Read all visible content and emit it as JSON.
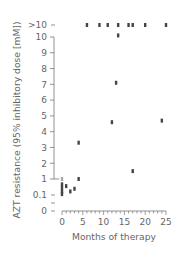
{
  "chart_data": {
    "type": "scatter",
    "title": "",
    "xlabel": "Months of therapy",
    "ylabel": "AZT resistance (95% inhibitory dose [mM])",
    "xlim": [
      0,
      25
    ],
    "x_ticks": [
      0,
      5,
      10,
      15,
      20,
      25
    ],
    "x_minor_tick_step": 1,
    "y_tick_labels": [
      "0",
      "0.1",
      "1",
      "2",
      "3",
      "4",
      "5",
      "6",
      "7",
      "8",
      "9",
      "10",
      ">10"
    ],
    "y_scale_note": "broken axis: 0, 0.1, 1 compressed; 1–10 linear; >10 category",
    "grid": false,
    "legend": null,
    "marker_color": "#444444",
    "points": [
      {
        "x": 0,
        "y": 1.0,
        "light": true
      },
      {
        "x": 0,
        "y": 0.7
      },
      {
        "x": 0,
        "y": 0.5
      },
      {
        "x": 0,
        "y": 0.3
      },
      {
        "x": 0,
        "y": 0.15
      },
      {
        "x": 1,
        "y": 0.6
      },
      {
        "x": 2,
        "y": 0.3
      },
      {
        "x": 3,
        "y": 0.45
      },
      {
        "x": 4,
        "y": 1.0
      },
      {
        "x": 4,
        "y": 3.3
      },
      {
        "x": 6,
        "y": ">10"
      },
      {
        "x": 9,
        "y": ">10"
      },
      {
        "x": 11,
        "y": ">10"
      },
      {
        "x": 12,
        "y": 4.6
      },
      {
        "x": 13,
        "y": 7.1
      },
      {
        "x": 13.5,
        "y": ">10"
      },
      {
        "x": 13.5,
        "y": 10.1
      },
      {
        "x": 16,
        "y": ">10"
      },
      {
        "x": 17,
        "y": ">10"
      },
      {
        "x": 17,
        "y": 1.5
      },
      {
        "x": 20,
        "y": ">10"
      },
      {
        "x": 24,
        "y": 4.7
      },
      {
        "x": 25,
        "y": ">10"
      }
    ]
  },
  "labels": {
    "xlabel": "Months of therapy",
    "ylabel": "AZT resistance (95% inhibitory dose [mM])",
    "x_ticks": [
      "0",
      "5",
      "10",
      "15",
      "20",
      "25"
    ],
    "y_gt10": ">10",
    "y_ticks": [
      "10",
      "9",
      "8",
      "7",
      "6",
      "5",
      "4",
      "3",
      "2",
      "1"
    ],
    "y_01": "0.1",
    "y_0": "0"
  }
}
